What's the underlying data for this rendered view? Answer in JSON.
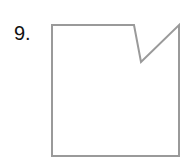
{
  "problem": {
    "number_label": "9."
  },
  "figure": {
    "shape": "pentagon-with-notch",
    "stroke_color": "#9a9a9a",
    "fill_color": "#ffffff",
    "stroke_width": 2,
    "points": "52,25 134,25 141,62 179,25 179,156 52,156"
  }
}
